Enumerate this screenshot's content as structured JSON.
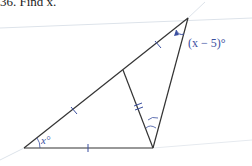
{
  "problem": {
    "title": "36. Find x."
  },
  "figure": {
    "labels": {
      "angle_bottom_left": "x°",
      "angle_top": "(x − 5)°"
    },
    "colors": {
      "lines": "#333333",
      "annotations": "#3a4fa0",
      "guide_lines": "#cfd6e0"
    }
  }
}
